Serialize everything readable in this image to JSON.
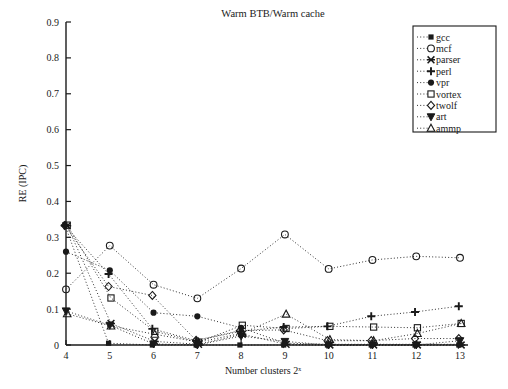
{
  "chart_data": {
    "type": "line",
    "title": "Warm BTB/Warm cache",
    "xlabel": "Number clusters 2ˣ",
    "ylabel": "RE (IPC)",
    "x": [
      4,
      5,
      6,
      7,
      8,
      9,
      10,
      11,
      12,
      13
    ],
    "xlim": [
      4,
      13
    ],
    "ylim": [
      0,
      0.9
    ],
    "ytick_labels": [
      "0",
      "0.1",
      "0.2",
      "0.3",
      "0.4",
      "0.5",
      "0.6",
      "0.7",
      "0.8",
      "0.9"
    ],
    "ytick_values": [
      0,
      0.1,
      0.2,
      0.3,
      0.4,
      0.5,
      0.6,
      0.7,
      0.8,
      0.9
    ],
    "xtick_labels": [
      "4",
      "5",
      "6",
      "7",
      "8",
      "9",
      "10",
      "11",
      "12",
      "13"
    ],
    "grid": false,
    "legend_position": "top-right",
    "linestyle": "dotted",
    "series": [
      {
        "name": "gcc",
        "marker": "square-filled",
        "values": [
          0.335,
          0.005,
          0.0,
          0.0,
          0.0,
          0.0,
          0.0,
          0.0,
          0.0,
          0.0
        ]
      },
      {
        "name": "mcf",
        "marker": "circle-open",
        "values": [
          0.155,
          0.277,
          0.168,
          0.13,
          0.213,
          0.308,
          0.212,
          0.237,
          0.247,
          0.243
        ]
      },
      {
        "name": "parser",
        "marker": "asterisk",
        "values": [
          0.332,
          0.06,
          0.01,
          0.002,
          0.03,
          0.002,
          0.0,
          0.0,
          0.0,
          0.0
        ]
      },
      {
        "name": "perl",
        "marker": "plus",
        "values": [
          0.333,
          0.198,
          0.045,
          0.012,
          0.038,
          0.05,
          0.052,
          0.08,
          0.092,
          0.108
        ]
      },
      {
        "name": "vpr",
        "marker": "circle-filled",
        "values": [
          0.26,
          0.208,
          0.09,
          0.08,
          0.048,
          0.005,
          0.002,
          0.002,
          0.002,
          0.002
        ]
      },
      {
        "name": "vortex",
        "marker": "square-open",
        "values": [
          0.334,
          0.131,
          0.038,
          0.008,
          0.055,
          0.046,
          0.052,
          0.05,
          0.048,
          0.06
        ]
      },
      {
        "name": "twolf",
        "marker": "diamond-open",
        "values": [
          0.333,
          0.163,
          0.138,
          0.013,
          0.04,
          0.042,
          0.012,
          0.012,
          0.018,
          0.018
        ]
      },
      {
        "name": "art",
        "marker": "triangle-down",
        "values": [
          0.095,
          0.055,
          0.003,
          0.0,
          0.025,
          0.01,
          0.0,
          0.0,
          0.0,
          0.012
        ]
      },
      {
        "name": "ammp",
        "marker": "triangle-up",
        "values": [
          0.087,
          0.053,
          0.03,
          0.008,
          0.033,
          0.086,
          0.015,
          0.012,
          0.032,
          0.06
        ]
      }
    ]
  },
  "legend": {
    "entries": [
      {
        "label": "gcc"
      },
      {
        "label": "mcf"
      },
      {
        "label": "parser"
      },
      {
        "label": "perl"
      },
      {
        "label": "vpr"
      },
      {
        "label": "vortex"
      },
      {
        "label": "twolf"
      },
      {
        "label": "art"
      },
      {
        "label": "ammp"
      }
    ]
  },
  "style": {
    "ink": "#1a1a1a",
    "background": "#ffffff"
  }
}
